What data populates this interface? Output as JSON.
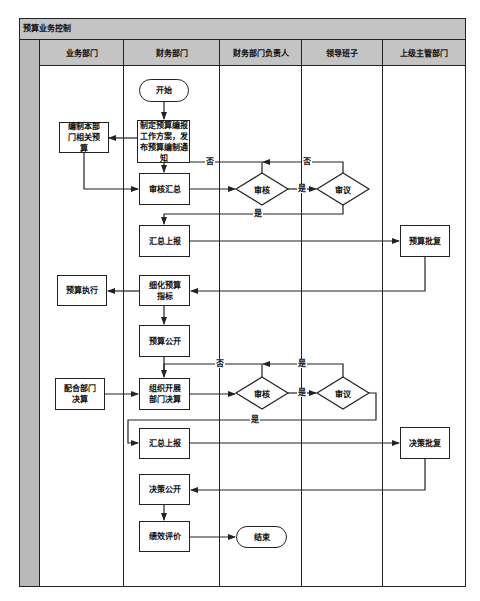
{
  "title": "预算业务控制",
  "lanes": [
    {
      "label": "业务部门"
    },
    {
      "label": "财务部门"
    },
    {
      "label": "财务部门负责人"
    },
    {
      "label": "领导班子"
    },
    {
      "label": "上级主管部门"
    }
  ],
  "nodes": {
    "start": "开始",
    "make_plan": "制定预算编报工作方案，发布预算编制通知",
    "dept_budget": "编制本部门相关预算",
    "review_summary": "审核汇总",
    "review_1": "审核",
    "deliberate_1": "审议",
    "submit_1": "汇总上报",
    "budget_approval": "预算批复",
    "refine_budget": "细化预算指标",
    "budget_execution": "预算执行",
    "budget_publish": "预算公开",
    "coordinate_final": "配合部门决算",
    "organize_final": "组织开展部门决算",
    "review_2": "审核",
    "deliberate_2": "审议",
    "submit_2": "汇总上报",
    "final_approval": "决策批复",
    "final_publish": "决策公开",
    "performance_eval": "绩效评价",
    "end": "结束"
  },
  "edge_labels": {
    "no_1a": "否",
    "no_1b": "否",
    "yes_1a": "是",
    "yes_1b": "是",
    "no_2": "否",
    "yes_2a": "是",
    "yes_2b": "是",
    "yes_2c": "是"
  },
  "colors": {
    "header_fill": "#c4c4c4",
    "strip_fill": "#b9b9b9",
    "line": "#222222"
  }
}
